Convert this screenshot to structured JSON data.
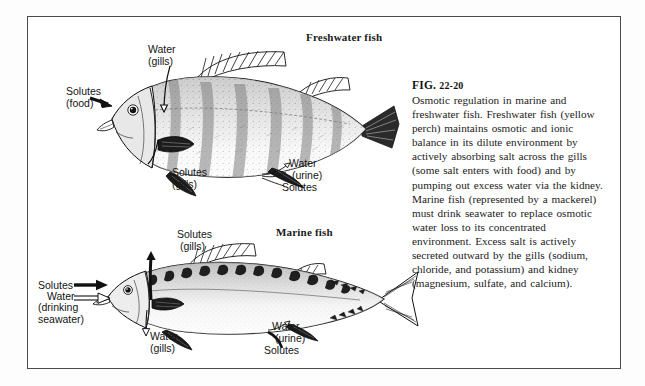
{
  "figure": {
    "frame_border_color": "#4a4a50",
    "background": "#ffffff",
    "ink_color": "#141414"
  },
  "panels": [
    {
      "id": "freshwater",
      "heading": "Freshwater fish",
      "species": "yellow perch"
    },
    {
      "id": "marine",
      "heading": "Marine fish",
      "species": "mackerel"
    }
  ],
  "headings": {
    "freshwater": "Freshwater fish",
    "marine": "Marine fish"
  },
  "caption": {
    "figure_number": "FIG. 22-20",
    "fig_prefix": "FIG.",
    "fig_id": "22-20",
    "body": "Osmotic regulation in marine and freshwater fish. Freshwater fish (yellow perch) maintains osmotic and ionic balance in its dilute environment by actively absorbing salt across the gills (some salt enters with food) and by pumping out excess water via the kidney. Marine fish (represented by a mackerel) must drink seawater to replace osmotic water loss to its concentrated environment. Excess salt is actively secreted outward by the gills (sodium, chloride, and potassium) and kidney (magnesium, sulfate, and calcium)."
  },
  "freshwater_labels": {
    "water_gills": "Water\n(gills)",
    "solutes_food": "Solutes\n(food)",
    "solutes_gills": "Solutes\n(gills)",
    "water_urine": "Water\n (urine)",
    "solutes_urine": "Solutes"
  },
  "marine_labels": {
    "solutes_gills": "Solutes\n (gills)",
    "solutes_in": "Solutes",
    "water_in": "Water",
    "drinking_seawater": "(drinking\nseawater)",
    "water_gills": "Water\n(gills)",
    "water_urine": "Water\n (urine)",
    "solutes_urine": "Solutes"
  },
  "arrow_legend": {
    "solid_arrow_means": "Solutes",
    "hollow_arrow_means": "Water"
  }
}
